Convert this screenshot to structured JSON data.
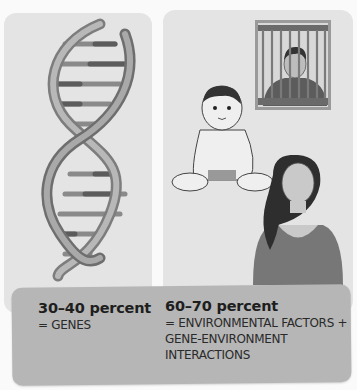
{
  "figure": {
    "panels": [
      {
        "id": "genes",
        "illustration": "dna-double-helix"
      },
      {
        "id": "environment",
        "illustrations": [
          "man-behind-bars",
          "seated-baby",
          "young-woman"
        ]
      }
    ],
    "caption": {
      "genes": {
        "heading": "30–40 percent",
        "description": "= GENES"
      },
      "environment": {
        "heading": "60–70 percent",
        "description_lines": [
          "= ENVIRONMENTAL FACTORS +",
          "GENE-ENVIRONMENT",
          "INTERACTIONS"
        ]
      }
    },
    "colors": {
      "panel_bg": "#e4e4e4",
      "caption_bg": "#b6b6b6",
      "page_bg": "#fafafa"
    }
  }
}
